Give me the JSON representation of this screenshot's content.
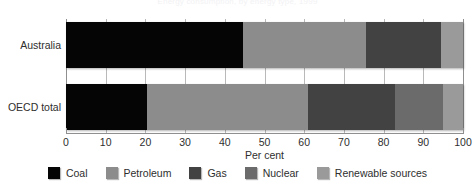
{
  "chart_data": {
    "type": "bar",
    "orientation": "horizontal",
    "stacked": true,
    "title": "Energy consumption, by energy type, 1999",
    "xlabel": "Per cent",
    "ylabel": "",
    "xlim": [
      0,
      100
    ],
    "xticks": [
      0,
      10,
      20,
      30,
      40,
      50,
      60,
      70,
      80,
      90,
      100
    ],
    "xtick_labels": [
      "0",
      "10",
      "20",
      "30",
      "40",
      "50",
      "60",
      "70",
      "80",
      "90",
      "100"
    ],
    "categories": [
      "Australia",
      "OECD total"
    ],
    "grid": true,
    "grid_axis": "x",
    "legend_position": "bottom",
    "series": [
      {
        "name": "Coal",
        "color": "#050505",
        "values": [
          44.5,
          20.5
        ]
      },
      {
        "name": "Petroleum",
        "color": "#8c8c8c",
        "values": [
          31.0,
          40.5
        ]
      },
      {
        "name": "Gas",
        "color": "#424242",
        "values": [
          19.0,
          22.0
        ]
      },
      {
        "name": "Nuclear",
        "color": "#6b6b6b",
        "values": [
          0.0,
          12.0
        ]
      },
      {
        "name": "Renewable sources",
        "color": "#9a9a9a",
        "values": [
          5.5,
          5.0
        ]
      }
    ]
  }
}
